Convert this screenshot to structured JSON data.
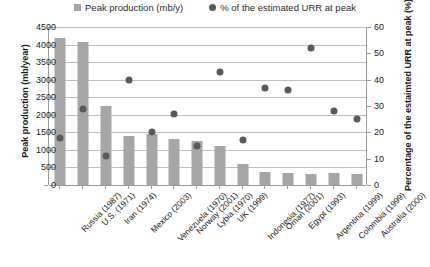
{
  "chart_data": {
    "type": "bar",
    "title": "",
    "xlabel": "",
    "ylabel": "Peak production (mb/year)",
    "y2label": "Percentage of the estaimted URR at peak (%)",
    "grid": true,
    "legend_position": "top-center",
    "ylim": [
      0,
      4500
    ],
    "y2lim": [
      0,
      60
    ],
    "yticks": [
      0,
      500,
      1000,
      1500,
      2000,
      2500,
      3000,
      3500,
      4000,
      4500
    ],
    "y2ticks": [
      0,
      10,
      20,
      30,
      40,
      50,
      60
    ],
    "categories": [
      "Russia (1987)",
      "U.S. (1971)",
      "Iran (1974)",
      "Mexico (2003)",
      "Venezuela (1970)",
      "Norway (2001)",
      "Lybia (1970)",
      "UK (1999)",
      "Indonesia (1977)",
      "Oman (2001)",
      "Egypt (1993)",
      "Argentina (1999)",
      "Colombia (1999)",
      "Australia (2000)"
    ],
    "series": [
      {
        "name": "Peak production (mb/y)",
        "type": "bar",
        "axis": "left",
        "color": "#a6a6a6",
        "values": [
          4180,
          4080,
          2250,
          1400,
          1450,
          1300,
          1250,
          1100,
          600,
          380,
          330,
          320,
          330,
          300
        ]
      },
      {
        "name": "% of the estimated URR at peak",
        "type": "scatter",
        "axis": "right",
        "color": "#595959",
        "values": [
          18,
          29,
          11,
          40,
          20,
          27,
          15,
          43,
          17,
          37,
          36,
          52,
          28,
          25
        ]
      }
    ]
  },
  "legend": {
    "entries": [
      {
        "label": "Peak production (mb/y)",
        "marker": "bar-swatch-icon"
      },
      {
        "label": "% of the estimated URR at peak",
        "marker": "dot-swatch-icon"
      }
    ]
  }
}
